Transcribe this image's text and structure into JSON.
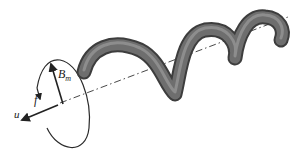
{
  "figure": {
    "labels": {
      "magnetic_field": {
        "base": "B",
        "subscript": "m"
      },
      "rotation": "f",
      "velocity": "u"
    },
    "colors": {
      "helix_fill": "#6e6e6e",
      "helix_dark": "#3d3d3d",
      "helix_light": "#9a9a9a",
      "lines": "#222222",
      "background": "#ffffff"
    }
  }
}
